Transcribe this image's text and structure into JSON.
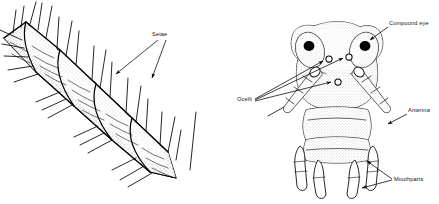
{
  "figure": {
    "background_color": "#ffffff",
    "ink_color": "#000000",
    "panels": [
      {
        "id": "left",
        "name": "segmented-appendage-with-setae",
        "description": "Oblique view of a segmented, stippled arthropod appendage bearing numerous long setae",
        "segment_count": 5
      },
      {
        "id": "right",
        "name": "anterior-head-view",
        "description": "Frontal (anterior) view of an arthropod head showing compound eyes, ocelli, antennae and mouthparts"
      }
    ]
  },
  "labels": {
    "setae": {
      "text": "Setae",
      "panel": "left",
      "leader_count": 2
    },
    "compound_eye": {
      "text": "Compound eye",
      "panel": "right",
      "leader_count": 1
    },
    "ocelli": {
      "text": "Ocelli",
      "panel": "right",
      "leader_count": 3
    },
    "antenna": {
      "text": "Antenna",
      "panel": "right",
      "leader_count": 1
    },
    "mouthparts": {
      "text": "Mouthparts",
      "panel": "right",
      "leader_count": 2
    }
  },
  "anatomy": {
    "compound_eyes": 2,
    "ocelli": 3,
    "antennae": 2,
    "mouthpart_appendages": 4,
    "body_segments_visible": 3
  }
}
